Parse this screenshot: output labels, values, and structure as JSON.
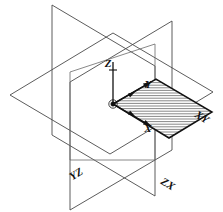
{
  "figure": {
    "background_color": "#ffffff",
    "width": 223,
    "height": 212
  },
  "axes": {
    "x": {
      "label": "X",
      "label_x": 148,
      "label_y": 132
    },
    "y": {
      "label": "Y",
      "label_x": 148,
      "label_y": 88
    },
    "z": {
      "label": "Z",
      "label_x": 108,
      "label_y": 67
    }
  },
  "planes": [
    {
      "id": "yz",
      "label": "YZ",
      "label_x": 78,
      "label_y": 177,
      "label_rotation": -32,
      "hatched": false,
      "stroke": "#4a4a4a"
    },
    {
      "id": "zx",
      "label": "ZX",
      "label_x": 166,
      "label_y": 187,
      "label_rotation": 32,
      "hatched": false,
      "stroke": "#4a4a4a"
    },
    {
      "id": "xy",
      "label": "XY",
      "label_x": 200,
      "label_y": 120,
      "label_rotation": 32,
      "hatched": true,
      "stroke": "#111111",
      "hatch_color": "#555555",
      "hatch_spacing": 2.6
    }
  ],
  "origin": {
    "label": "",
    "x": 113,
    "y": 104
  },
  "colors": {
    "outline": "#4a4a4a",
    "emphasis": "#111111",
    "hatch": "#555555",
    "background": "#ffffff"
  }
}
